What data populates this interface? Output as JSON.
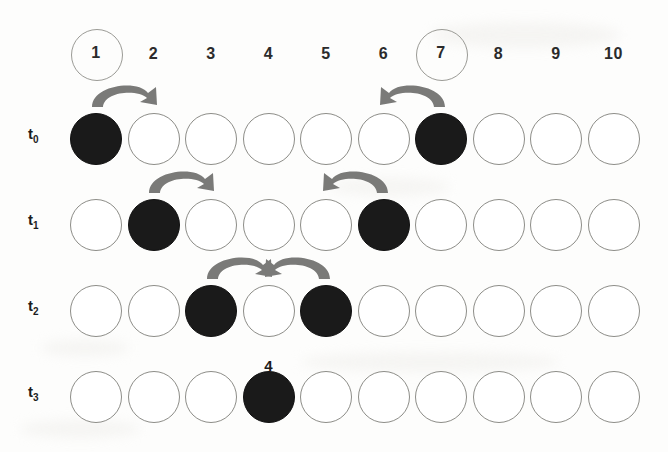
{
  "figure": {
    "column_count": 10,
    "columns": [
      {
        "label": "1",
        "highlighted": true
      },
      {
        "label": "2",
        "highlighted": false
      },
      {
        "label": "3",
        "highlighted": false
      },
      {
        "label": "4",
        "highlighted": false
      },
      {
        "label": "5",
        "highlighted": false
      },
      {
        "label": "6",
        "highlighted": false
      },
      {
        "label": "7",
        "highlighted": true
      },
      {
        "label": "8",
        "highlighted": false
      },
      {
        "label": "9",
        "highlighted": false
      },
      {
        "label": "10",
        "highlighted": false
      }
    ],
    "colors": {
      "filled_cell": "#1a1a1a",
      "empty_cell_stroke": "#8d8d88",
      "arrow": "#7a7a78",
      "background": "#fdfdfc",
      "text": "#1c1c1c"
    },
    "rows": [
      {
        "label": "t",
        "subscript": "0",
        "name": "row-t0",
        "cells": [
          {
            "state": "filled",
            "tag": null
          },
          {
            "state": "empty",
            "tag": null
          },
          {
            "state": "empty",
            "tag": null
          },
          {
            "state": "empty",
            "tag": null
          },
          {
            "state": "empty",
            "tag": null
          },
          {
            "state": "empty",
            "tag": null
          },
          {
            "state": "filled",
            "tag": null
          },
          {
            "state": "empty",
            "tag": null
          },
          {
            "state": "empty",
            "tag": null
          },
          {
            "state": "empty",
            "tag": null
          }
        ],
        "arrows": [
          {
            "from": 1,
            "to": 2,
            "direction": "right"
          },
          {
            "from": 7,
            "to": 6,
            "direction": "left"
          }
        ]
      },
      {
        "label": "t",
        "subscript": "1",
        "name": "row-t1",
        "cells": [
          {
            "state": "empty",
            "tag": null
          },
          {
            "state": "filled",
            "tag": null
          },
          {
            "state": "empty",
            "tag": null
          },
          {
            "state": "empty",
            "tag": null
          },
          {
            "state": "empty",
            "tag": null
          },
          {
            "state": "filled",
            "tag": null
          },
          {
            "state": "empty",
            "tag": null
          },
          {
            "state": "empty",
            "tag": null
          },
          {
            "state": "empty",
            "tag": null
          },
          {
            "state": "empty",
            "tag": null
          }
        ],
        "arrows": [
          {
            "from": 2,
            "to": 3,
            "direction": "right"
          },
          {
            "from": 6,
            "to": 5,
            "direction": "left"
          }
        ]
      },
      {
        "label": "t",
        "subscript": "2",
        "name": "row-t2",
        "cells": [
          {
            "state": "empty",
            "tag": null
          },
          {
            "state": "empty",
            "tag": null
          },
          {
            "state": "filled",
            "tag": null
          },
          {
            "state": "empty",
            "tag": null
          },
          {
            "state": "filled",
            "tag": null
          },
          {
            "state": "empty",
            "tag": null
          },
          {
            "state": "empty",
            "tag": null
          },
          {
            "state": "empty",
            "tag": null
          },
          {
            "state": "empty",
            "tag": null
          },
          {
            "state": "empty",
            "tag": null
          }
        ],
        "arrows": [
          {
            "from": 3,
            "to": 4,
            "direction": "right"
          },
          {
            "from": 5,
            "to": 4,
            "direction": "left"
          }
        ]
      },
      {
        "label": "t",
        "subscript": "3",
        "name": "row-t3",
        "cells": [
          {
            "state": "empty",
            "tag": null
          },
          {
            "state": "empty",
            "tag": null
          },
          {
            "state": "empty",
            "tag": null
          },
          {
            "state": "filled",
            "tag": "4"
          },
          {
            "state": "empty",
            "tag": null
          },
          {
            "state": "empty",
            "tag": null
          },
          {
            "state": "empty",
            "tag": null
          },
          {
            "state": "empty",
            "tag": null
          },
          {
            "state": "empty",
            "tag": null
          },
          {
            "state": "empty",
            "tag": null
          }
        ],
        "arrows": []
      }
    ]
  }
}
